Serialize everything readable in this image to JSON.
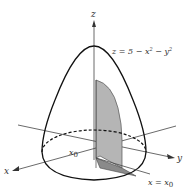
{
  "figure": {
    "type": "3d-surface-diagram",
    "surface_equation": "z = 5 − x² − y²",
    "surface_label_parts": {
      "lhs": "z = 5 − x",
      "sup1": "2",
      "mid": " − y",
      "sup2": "2"
    },
    "axes": {
      "z": "z",
      "x": "x",
      "y": "y"
    },
    "plane_label": {
      "var": "x = x",
      "sub": "0"
    },
    "point_label": {
      "var": "x",
      "sub": "0"
    },
    "colors": {
      "outline": "#111111",
      "axis": "#333333",
      "slab_fill": "#b5b5b5",
      "slab_bottom_fill": "#8a8a8a",
      "background": "#ffffff"
    }
  }
}
